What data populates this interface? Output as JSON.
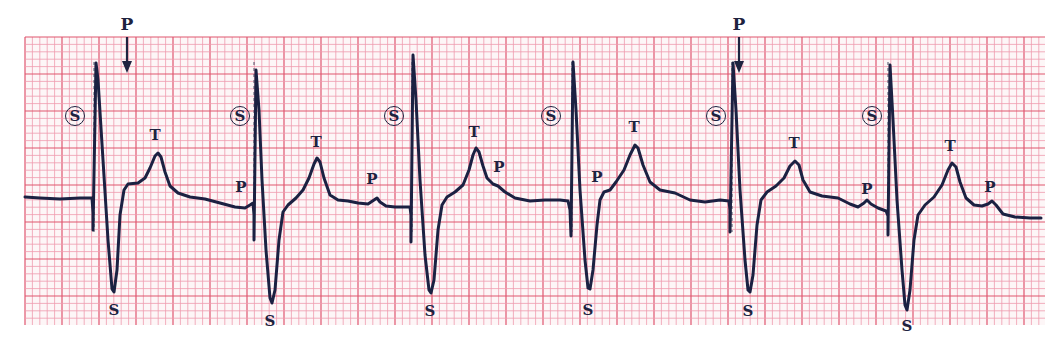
{
  "figure": {
    "paper": {
      "background": "#fdf6f7",
      "minor_grid_color": "#ef9aae",
      "major_grid_color": "#e0566f",
      "trace_color": "#1b2142",
      "label_color": "#1e2340",
      "minor_spacing_px": 7.4,
      "major_every": 5,
      "grid_bounds": {
        "x0": 25,
        "y0": 37,
        "x1": 1045,
        "y1": 325
      }
    },
    "arrows": [
      {
        "label": "P",
        "x": 127,
        "label_y": 30,
        "y_start": 37,
        "y_end": 73
      },
      {
        "label": "P",
        "x": 739,
        "label_y": 30,
        "y_start": 37,
        "y_end": 73
      }
    ],
    "pacing_markers": [
      {
        "label": "S",
        "x": 75,
        "y": 116,
        "marker_x": 94
      },
      {
        "label": "S",
        "x": 240,
        "y": 116,
        "marker_x": 254
      },
      {
        "label": "S",
        "x": 394,
        "y": 116,
        "marker_x": 412
      },
      {
        "label": "S",
        "x": 551,
        "y": 116,
        "marker_x": 572
      },
      {
        "label": "S",
        "x": 716,
        "y": 116,
        "marker_x": 732
      },
      {
        "label": "S",
        "x": 872,
        "y": 116,
        "marker_x": 888
      }
    ],
    "wave_labels": [
      {
        "label": "T",
        "x": 155,
        "y": 140
      },
      {
        "label": "P",
        "x": 241,
        "y": 192
      },
      {
        "label": "S",
        "x": 114,
        "y": 315
      },
      {
        "label": "T",
        "x": 316,
        "y": 147
      },
      {
        "label": "P",
        "x": 372,
        "y": 184
      },
      {
        "label": "S",
        "x": 270,
        "y": 326
      },
      {
        "label": "T",
        "x": 474,
        "y": 137
      },
      {
        "label": "P",
        "x": 499,
        "y": 172
      },
      {
        "label": "S",
        "x": 430,
        "y": 316
      },
      {
        "label": "P",
        "x": 597,
        "y": 182
      },
      {
        "label": "T",
        "x": 634,
        "y": 132
      },
      {
        "label": "S",
        "x": 588,
        "y": 315
      },
      {
        "label": "T",
        "x": 794,
        "y": 148
      },
      {
        "label": "P",
        "x": 867,
        "y": 194
      },
      {
        "label": "S",
        "x": 748,
        "y": 316
      },
      {
        "label": "T",
        "x": 950,
        "y": 151
      },
      {
        "label": "P",
        "x": 990,
        "y": 192
      },
      {
        "label": "S",
        "x": 907,
        "y": 331
      }
    ],
    "trace_points": [
      [
        25,
        197
      ],
      [
        40,
        198
      ],
      [
        60,
        199
      ],
      [
        80,
        198
      ],
      [
        92,
        198
      ],
      [
        93,
        213
      ],
      [
        93,
        230
      ],
      [
        96,
        63
      ],
      [
        98,
        80
      ],
      [
        103,
        160
      ],
      [
        108,
        240
      ],
      [
        112,
        289
      ],
      [
        114,
        292
      ],
      [
        117,
        270
      ],
      [
        120,
        215
      ],
      [
        124,
        190
      ],
      [
        128,
        184
      ],
      [
        138,
        183
      ],
      [
        145,
        178
      ],
      [
        150,
        168
      ],
      [
        155,
        156
      ],
      [
        158,
        153
      ],
      [
        161,
        157
      ],
      [
        165,
        172
      ],
      [
        170,
        186
      ],
      [
        178,
        193
      ],
      [
        190,
        197
      ],
      [
        205,
        199
      ],
      [
        220,
        203
      ],
      [
        235,
        207
      ],
      [
        245,
        208
      ],
      [
        250,
        205
      ],
      [
        253,
        203
      ],
      [
        254,
        215
      ],
      [
        254,
        240
      ],
      [
        256,
        70
      ],
      [
        259,
        110
      ],
      [
        262,
        180
      ],
      [
        266,
        250
      ],
      [
        270,
        298
      ],
      [
        272,
        303
      ],
      [
        275,
        290
      ],
      [
        279,
        240
      ],
      [
        283,
        212
      ],
      [
        288,
        205
      ],
      [
        296,
        198
      ],
      [
        303,
        190
      ],
      [
        309,
        178
      ],
      [
        314,
        164
      ],
      [
        317,
        158
      ],
      [
        320,
        162
      ],
      [
        324,
        178
      ],
      [
        330,
        195
      ],
      [
        338,
        200
      ],
      [
        348,
        201
      ],
      [
        358,
        203
      ],
      [
        368,
        204
      ],
      [
        374,
        200
      ],
      [
        377,
        198
      ],
      [
        380,
        202
      ],
      [
        386,
        206
      ],
      [
        395,
        207
      ],
      [
        405,
        207
      ],
      [
        410,
        207
      ],
      [
        411,
        215
      ],
      [
        411,
        242
      ],
      [
        413,
        55
      ],
      [
        416,
        100
      ],
      [
        420,
        180
      ],
      [
        425,
        255
      ],
      [
        429,
        290
      ],
      [
        431,
        293
      ],
      [
        434,
        280
      ],
      [
        438,
        230
      ],
      [
        442,
        205
      ],
      [
        447,
        197
      ],
      [
        455,
        192
      ],
      [
        463,
        185
      ],
      [
        469,
        170
      ],
      [
        473,
        155
      ],
      [
        476,
        148
      ],
      [
        479,
        152
      ],
      [
        483,
        166
      ],
      [
        487,
        178
      ],
      [
        493,
        184
      ],
      [
        498,
        186
      ],
      [
        505,
        192
      ],
      [
        515,
        198
      ],
      [
        530,
        201
      ],
      [
        545,
        200
      ],
      [
        560,
        200
      ],
      [
        568,
        201
      ],
      [
        570,
        210
      ],
      [
        571,
        236
      ],
      [
        573,
        62
      ],
      [
        576,
        110
      ],
      [
        580,
        190
      ],
      [
        585,
        260
      ],
      [
        588,
        288
      ],
      [
        590,
        289
      ],
      [
        593,
        270
      ],
      [
        597,
        225
      ],
      [
        600,
        200
      ],
      [
        604,
        192
      ],
      [
        610,
        190
      ],
      [
        616,
        182
      ],
      [
        624,
        170
      ],
      [
        630,
        155
      ],
      [
        635,
        145
      ],
      [
        638,
        148
      ],
      [
        643,
        165
      ],
      [
        650,
        182
      ],
      [
        660,
        190
      ],
      [
        675,
        193
      ],
      [
        690,
        200
      ],
      [
        705,
        202
      ],
      [
        720,
        200
      ],
      [
        729,
        201
      ],
      [
        730,
        210
      ],
      [
        730,
        232
      ],
      [
        733,
        63
      ],
      [
        736,
        110
      ],
      [
        740,
        190
      ],
      [
        745,
        260
      ],
      [
        748,
        290
      ],
      [
        750,
        292
      ],
      [
        753,
        275
      ],
      [
        757,
        225
      ],
      [
        761,
        200
      ],
      [
        767,
        192
      ],
      [
        776,
        186
      ],
      [
        784,
        178
      ],
      [
        790,
        166
      ],
      [
        795,
        161
      ],
      [
        799,
        165
      ],
      [
        803,
        180
      ],
      [
        810,
        192
      ],
      [
        822,
        196
      ],
      [
        838,
        198
      ],
      [
        850,
        204
      ],
      [
        858,
        207
      ],
      [
        864,
        203
      ],
      [
        867,
        200
      ],
      [
        871,
        204
      ],
      [
        878,
        208
      ],
      [
        886,
        211
      ],
      [
        888,
        216
      ],
      [
        888,
        235
      ],
      [
        890,
        65
      ],
      [
        893,
        120
      ],
      [
        897,
        200
      ],
      [
        902,
        270
      ],
      [
        905,
        305
      ],
      [
        907,
        310
      ],
      [
        910,
        290
      ],
      [
        914,
        240
      ],
      [
        918,
        215
      ],
      [
        925,
        205
      ],
      [
        934,
        197
      ],
      [
        942,
        185
      ],
      [
        948,
        170
      ],
      [
        952,
        163
      ],
      [
        956,
        167
      ],
      [
        960,
        182
      ],
      [
        966,
        198
      ],
      [
        974,
        205
      ],
      [
        982,
        206
      ],
      [
        988,
        204
      ],
      [
        992,
        201
      ],
      [
        996,
        205
      ],
      [
        1003,
        214
      ],
      [
        1015,
        217
      ],
      [
        1030,
        218
      ],
      [
        1041,
        218
      ]
    ]
  }
}
